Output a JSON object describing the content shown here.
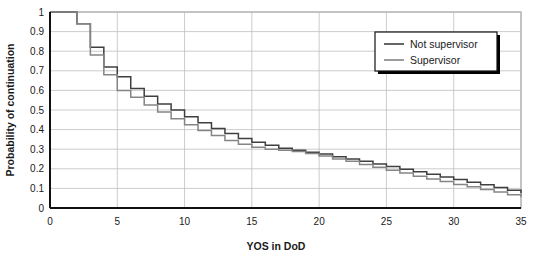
{
  "chart_data": {
    "type": "line",
    "subtype": "step",
    "title": "",
    "xlabel": "YOS in DoD",
    "ylabel": "Probability of continuation",
    "xlim": [
      0,
      35
    ],
    "ylim": [
      0,
      1
    ],
    "xticks": [
      0,
      5,
      10,
      15,
      20,
      25,
      30,
      35
    ],
    "xtick_labels": [
      "0",
      "5",
      "10",
      "15",
      "20",
      "25",
      "30",
      "35"
    ],
    "yticks": [
      0,
      0.1,
      0.2,
      0.3,
      0.4,
      0.5,
      0.6,
      0.7,
      0.8,
      0.9,
      1
    ],
    "ytick_labels": [
      "0",
      "0.1",
      "0.2",
      "0.3",
      "0.4",
      "0.5",
      "0.6",
      "0.7",
      "0.8",
      "0.9",
      "1"
    ],
    "grid": "both",
    "grid_color": "#bfbfbf",
    "legend_position": "top-right",
    "x": [
      0,
      1,
      2,
      3,
      4,
      5,
      6,
      7,
      8,
      9,
      10,
      11,
      12,
      13,
      14,
      15,
      16,
      17,
      18,
      19,
      20,
      21,
      22,
      23,
      24,
      25,
      26,
      27,
      28,
      29,
      30,
      31,
      32,
      33,
      34,
      35
    ],
    "series": [
      {
        "name": "Not supervisor",
        "color": "#3f3f3f",
        "values": [
          1.0,
          1.0,
          0.94,
          0.82,
          0.72,
          0.67,
          0.61,
          0.57,
          0.53,
          0.5,
          0.465,
          0.435,
          0.405,
          0.38,
          0.355,
          0.335,
          0.32,
          0.305,
          0.295,
          0.285,
          0.275,
          0.262,
          0.25,
          0.238,
          0.225,
          0.212,
          0.198,
          0.185,
          0.172,
          0.158,
          0.145,
          0.132,
          0.118,
          0.105,
          0.09,
          0.075
        ]
      },
      {
        "name": "Supervisor",
        "color": "#858585",
        "values": [
          1.0,
          1.0,
          0.94,
          0.78,
          0.68,
          0.6,
          0.565,
          0.525,
          0.49,
          0.455,
          0.425,
          0.395,
          0.37,
          0.345,
          0.325,
          0.31,
          0.3,
          0.295,
          0.288,
          0.278,
          0.265,
          0.25,
          0.238,
          0.222,
          0.208,
          0.192,
          0.178,
          0.162,
          0.148,
          0.135,
          0.12,
          0.108,
          0.095,
          0.082,
          0.068,
          0.055
        ]
      }
    ]
  },
  "legend": {
    "entries": [
      {
        "label": "Not supervisor"
      },
      {
        "label": "Supervisor"
      }
    ]
  }
}
